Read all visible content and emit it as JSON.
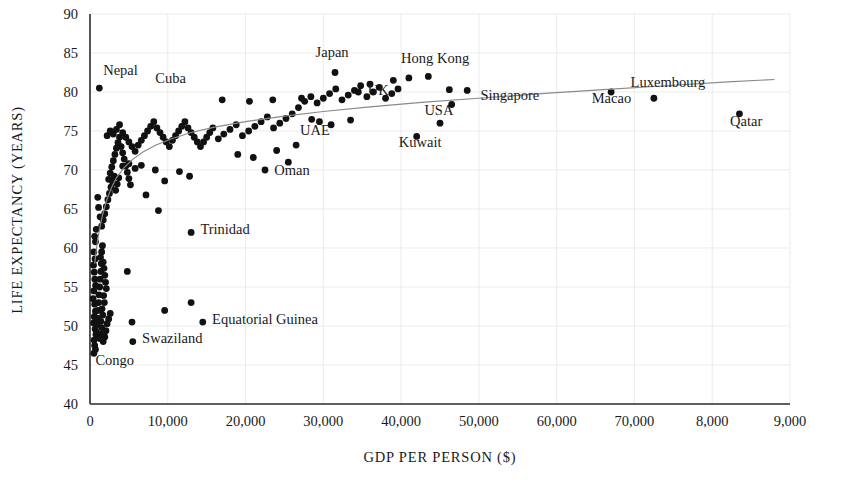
{
  "chart_data": {
    "type": "scatter",
    "title": "",
    "xlabel": "GDP PER PERSON ($)",
    "ylabel": "LIFE EXPECTANCY (YEARS)",
    "xlim": [
      0,
      90000
    ],
    "ylim": [
      40,
      90
    ],
    "grid": true,
    "legend": "none",
    "x_ticks": [
      0,
      10000,
      20000,
      30000,
      40000,
      50000,
      60000,
      70000,
      80000,
      90000
    ],
    "x_tick_labels": [
      "0",
      "10,000",
      "20,000",
      "30,000",
      "40,000",
      "50,000",
      "60,000",
      "70,000",
      "8,000",
      "9,000"
    ],
    "y_ticks": [
      40,
      45,
      50,
      55,
      60,
      65,
      70,
      75,
      80,
      85,
      90
    ],
    "y_tick_labels": [
      "40",
      "45",
      "50",
      "55",
      "60",
      "65",
      "70",
      "75",
      "80",
      "85",
      "90"
    ],
    "series_name": "Countries",
    "point_color": "#111111",
    "trend_color": "#8a8a8a",
    "trend_note": "logarithmic best-fit curve",
    "trend_points": [
      [
        600,
        58.0
      ],
      [
        900,
        60.5
      ],
      [
        1200,
        62.3
      ],
      [
        1600,
        64.2
      ],
      [
        2100,
        66.0
      ],
      [
        2700,
        67.6
      ],
      [
        3400,
        69.0
      ],
      [
        4300,
        70.2
      ],
      [
        5400,
        71.3
      ],
      [
        6800,
        72.3
      ],
      [
        8500,
        73.2
      ],
      [
        10500,
        74.0
      ],
      [
        13000,
        74.8
      ],
      [
        16000,
        75.5
      ],
      [
        20000,
        76.2
      ],
      [
        25000,
        76.9
      ],
      [
        30000,
        77.5
      ],
      [
        36000,
        78.1
      ],
      [
        43000,
        78.7
      ],
      [
        50000,
        79.2
      ],
      [
        58000,
        79.8
      ],
      [
        66000,
        80.3
      ],
      [
        74000,
        80.8
      ],
      [
        82000,
        81.3
      ],
      [
        88000,
        81.6
      ]
    ],
    "labeled_points": [
      {
        "name": "Nepal",
        "gdp": 1200,
        "life": 80.5
      },
      {
        "name": "Cuba",
        "gdp": 9500,
        "life": 79.0
      },
      {
        "name": "Japan",
        "gdp": 31500,
        "life": 82.5
      },
      {
        "name": "Hong Kong",
        "gdp": 43500,
        "life": 82.0
      },
      {
        "name": "UK",
        "gdp": 34500,
        "life": 80.0
      },
      {
        "name": "Singapore",
        "gdp": 48500,
        "life": 80.2
      },
      {
        "name": "Macao",
        "gdp": 67000,
        "life": 80.0
      },
      {
        "name": "Luxembourg",
        "gdp": 72500,
        "life": 79.2
      },
      {
        "name": "Qatar",
        "gdp": 83500,
        "life": 77.2
      },
      {
        "name": "USA",
        "gdp": 46500,
        "life": 78.4
      },
      {
        "name": "UAE",
        "gdp": 28500,
        "life": 76.5
      },
      {
        "name": "Kuwait",
        "gdp": 42000,
        "life": 74.3
      },
      {
        "name": "Oman",
        "gdp": 22500,
        "life": 70.0
      },
      {
        "name": "Trinidad",
        "gdp": 13000,
        "life": 62.0
      },
      {
        "name": "Equatorial Guinea",
        "gdp": 14500,
        "life": 50.5
      },
      {
        "name": "Swaziland",
        "gdp": 5500,
        "life": 48.0
      },
      {
        "name": "Congo",
        "gdp": 500,
        "life": 46.5
      }
    ],
    "label_annotations": [
      {
        "text": "Nepal",
        "gdp": 1700,
        "life": 82.2,
        "anchor": "start"
      },
      {
        "text": "Cuba",
        "gdp": 8400,
        "life": 81.2,
        "anchor": "start"
      },
      {
        "text": "Japan",
        "gdp": 29000,
        "life": 84.5,
        "anchor": "start"
      },
      {
        "text": "Hong Kong",
        "gdp": 40000,
        "life": 83.7,
        "anchor": "start"
      },
      {
        "text": "UK",
        "gdp": 35700,
        "life": 79.6,
        "anchor": "start"
      },
      {
        "text": "Singapore",
        "gdp": 50200,
        "life": 79.0,
        "anchor": "start"
      },
      {
        "text": "Macao",
        "gdp": 64500,
        "life": 78.6,
        "anchor": "start"
      },
      {
        "text": "Luxembourg",
        "gdp": 69500,
        "life": 80.6,
        "anchor": "start"
      },
      {
        "text": "Qatar",
        "gdp": 82300,
        "life": 75.7,
        "anchor": "start"
      },
      {
        "text": "USA",
        "gdp": 43000,
        "life": 77.0,
        "anchor": "start"
      },
      {
        "text": "UAE",
        "gdp": 27000,
        "life": 74.5,
        "anchor": "start"
      },
      {
        "text": "Kuwait",
        "gdp": 39700,
        "life": 72.9,
        "anchor": "start"
      },
      {
        "text": "Oman",
        "gdp": 23700,
        "life": 69.4,
        "anchor": "start"
      },
      {
        "text": "Trinidad",
        "gdp": 14200,
        "life": 61.8,
        "anchor": "start"
      },
      {
        "text": "Equatorial Guinea",
        "gdp": 15700,
        "life": 50.3,
        "anchor": "start"
      },
      {
        "text": "Swaziland",
        "gdp": 6700,
        "life": 47.8,
        "anchor": "start"
      },
      {
        "text": "Congo",
        "gdp": 700,
        "life": 45.0,
        "anchor": "start"
      }
    ],
    "points": [
      [
        1200,
        80.5
      ],
      [
        600,
        61.5
      ],
      [
        700,
        60.8
      ],
      [
        500,
        59.5
      ],
      [
        650,
        58.6
      ],
      [
        800,
        62.4
      ],
      [
        450,
        57.8
      ],
      [
        550,
        56.9
      ],
      [
        620,
        56.0
      ],
      [
        720,
        55.2
      ],
      [
        500,
        54.5
      ],
      [
        400,
        53.5
      ],
      [
        600,
        52.8
      ],
      [
        700,
        51.9
      ],
      [
        550,
        51.2
      ],
      [
        480,
        50.4
      ],
      [
        650,
        49.6
      ],
      [
        760,
        48.9
      ],
      [
        520,
        48.2
      ],
      [
        600,
        47.5
      ],
      [
        700,
        47.0
      ],
      [
        820,
        49.2
      ],
      [
        900,
        50.2
      ],
      [
        950,
        51.0
      ],
      [
        1050,
        52.0
      ],
      [
        1100,
        53.0
      ],
      [
        1150,
        54.0
      ],
      [
        1250,
        55.0
      ],
      [
        1300,
        56.0
      ],
      [
        1400,
        57.0
      ],
      [
        1450,
        58.0
      ],
      [
        1350,
        58.8
      ],
      [
        1500,
        59.5
      ],
      [
        1600,
        60.3
      ],
      [
        1700,
        58.2
      ],
      [
        1800,
        57.4
      ],
      [
        1900,
        56.5
      ],
      [
        2000,
        55.6
      ],
      [
        2100,
        54.8
      ],
      [
        1750,
        53.9
      ],
      [
        1850,
        53.0
      ],
      [
        1550,
        52.2
      ],
      [
        1650,
        51.4
      ],
      [
        1400,
        50.6
      ],
      [
        1500,
        49.8
      ],
      [
        1350,
        49.0
      ],
      [
        1250,
        48.4
      ],
      [
        1700,
        48.0
      ],
      [
        1900,
        48.6
      ],
      [
        2050,
        49.4
      ],
      [
        2200,
        50.3
      ],
      [
        2400,
        50.9
      ],
      [
        2600,
        51.6
      ],
      [
        1000,
        66.5
      ],
      [
        1100,
        65.2
      ],
      [
        1300,
        64.0
      ],
      [
        1500,
        62.8
      ],
      [
        1700,
        63.6
      ],
      [
        1900,
        64.4
      ],
      [
        2100,
        65.3
      ],
      [
        2300,
        66.2
      ],
      [
        2500,
        67.0
      ],
      [
        2700,
        67.8
      ],
      [
        2900,
        68.5
      ],
      [
        3100,
        69.2
      ],
      [
        3300,
        67.4
      ],
      [
        3500,
        68.2
      ],
      [
        3700,
        69.0
      ],
      [
        2400,
        68.8
      ],
      [
        2600,
        69.6
      ],
      [
        2800,
        70.4
      ],
      [
        3000,
        71.2
      ],
      [
        3200,
        72.0
      ],
      [
        3400,
        72.8
      ],
      [
        3600,
        73.5
      ],
      [
        3800,
        74.2
      ],
      [
        4000,
        73.0
      ],
      [
        4200,
        72.2
      ],
      [
        4400,
        71.4
      ],
      [
        4600,
        70.5
      ],
      [
        4800,
        69.7
      ],
      [
        5000,
        68.9
      ],
      [
        5200,
        68.1
      ],
      [
        2200,
        74.4
      ],
      [
        2600,
        75.0
      ],
      [
        3000,
        74.6
      ],
      [
        3400,
        75.2
      ],
      [
        3800,
        75.8
      ],
      [
        4200,
        74.8
      ],
      [
        4600,
        74.2
      ],
      [
        5000,
        73.6
      ],
      [
        5400,
        73.0
      ],
      [
        5800,
        72.4
      ],
      [
        6200,
        73.2
      ],
      [
        6600,
        73.8
      ],
      [
        7000,
        74.4
      ],
      [
        7400,
        75.0
      ],
      [
        7800,
        75.6
      ],
      [
        8200,
        76.2
      ],
      [
        8600,
        75.4
      ],
      [
        9000,
        74.8
      ],
      [
        9400,
        74.2
      ],
      [
        9800,
        73.6
      ],
      [
        10200,
        73.0
      ],
      [
        10600,
        73.8
      ],
      [
        11000,
        74.4
      ],
      [
        11400,
        75.0
      ],
      [
        11800,
        75.6
      ],
      [
        12200,
        76.2
      ],
      [
        12600,
        75.4
      ],
      [
        13000,
        74.8
      ],
      [
        13400,
        74.2
      ],
      [
        13800,
        73.6
      ],
      [
        14200,
        73.0
      ],
      [
        14600,
        73.6
      ],
      [
        15000,
        74.2
      ],
      [
        15400,
        74.8
      ],
      [
        15800,
        75.4
      ],
      [
        16500,
        74.0
      ],
      [
        17200,
        74.6
      ],
      [
        18000,
        75.2
      ],
      [
        18800,
        75.8
      ],
      [
        19600,
        74.4
      ],
      [
        20400,
        75.0
      ],
      [
        21200,
        75.6
      ],
      [
        22000,
        76.2
      ],
      [
        22800,
        76.8
      ],
      [
        23600,
        75.4
      ],
      [
        24400,
        76.0
      ],
      [
        25200,
        76.6
      ],
      [
        26000,
        77.2
      ],
      [
        26800,
        78.0
      ],
      [
        27600,
        78.8
      ],
      [
        28400,
        79.4
      ],
      [
        29200,
        78.6
      ],
      [
        30000,
        79.2
      ],
      [
        30800,
        79.8
      ],
      [
        31600,
        80.4
      ],
      [
        32400,
        79.0
      ],
      [
        33200,
        79.6
      ],
      [
        34000,
        80.2
      ],
      [
        34800,
        80.8
      ],
      [
        35600,
        79.4
      ],
      [
        36400,
        80.0
      ],
      [
        37200,
        80.6
      ],
      [
        38000,
        79.2
      ],
      [
        38800,
        79.8
      ],
      [
        39600,
        80.4
      ],
      [
        4200,
        70.5
      ],
      [
        5000,
        70.8
      ],
      [
        5800,
        70.2
      ],
      [
        6600,
        70.6
      ],
      [
        8400,
        70.0
      ],
      [
        9600,
        68.6
      ],
      [
        11500,
        69.8
      ],
      [
        12800,
        69.2
      ],
      [
        7200,
        66.8
      ],
      [
        8800,
        64.8
      ],
      [
        4800,
        57.0
      ],
      [
        9600,
        52.0
      ],
      [
        13000,
        53.0
      ],
      [
        5400,
        50.5
      ],
      [
        31500,
        82.5
      ],
      [
        43500,
        82.0
      ],
      [
        34500,
        80.0
      ],
      [
        48500,
        80.2
      ],
      [
        46200,
        80.3
      ],
      [
        67000,
        80.0
      ],
      [
        72500,
        79.2
      ],
      [
        83500,
        77.2
      ],
      [
        46500,
        78.4
      ],
      [
        42000,
        74.3
      ],
      [
        28500,
        76.5
      ],
      [
        22500,
        70.0
      ],
      [
        13000,
        62.0
      ],
      [
        14500,
        50.5
      ],
      [
        5500,
        48.0
      ],
      [
        500,
        46.5
      ],
      [
        23500,
        79.0
      ],
      [
        27200,
        79.2
      ],
      [
        17000,
        79.0
      ],
      [
        20500,
        78.8
      ],
      [
        36000,
        81.0
      ],
      [
        39000,
        81.5
      ],
      [
        41000,
        81.8
      ],
      [
        45000,
        76.0
      ],
      [
        24000,
        72.5
      ],
      [
        26500,
        73.2
      ],
      [
        31000,
        75.8
      ],
      [
        33500,
        76.4
      ],
      [
        19000,
        72.0
      ],
      [
        21000,
        71.6
      ],
      [
        25500,
        71.0
      ],
      [
        29500,
        76.2
      ]
    ]
  }
}
